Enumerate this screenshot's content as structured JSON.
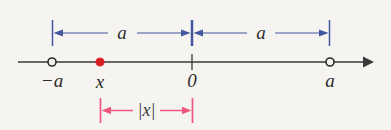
{
  "figure": {
    "kind": "number-line-diagram",
    "width": 391,
    "height": 130,
    "background_color": "#f6f4f1",
    "axis": {
      "color": "#3a3a3a",
      "y": 62,
      "x_start": 18,
      "x_end": 372,
      "arrow_right": true
    },
    "colors": {
      "axis": "#3a3a3a",
      "point_filled": "#d81f26",
      "point_open_stroke": "#2b2b2b",
      "point_open_fill": "#f6f4f1",
      "measure_blue": "#4257a0",
      "measure_red": "#f0577f",
      "text": "#2b2b2b"
    },
    "points": [
      {
        "name": "negative-a",
        "label": "−a",
        "x": 52,
        "marker": "open-circle"
      },
      {
        "name": "x",
        "label": "x",
        "x": 100,
        "marker": "filled-circle"
      },
      {
        "name": "zero",
        "label": "0",
        "x": 192,
        "marker": "tick"
      },
      {
        "name": "a",
        "label": "a",
        "x": 330,
        "marker": "open-circle"
      }
    ],
    "measures": [
      {
        "name": "left-a-span",
        "label": "a",
        "color": "#4257a0",
        "x_from": 52,
        "x_to": 192,
        "y": 33,
        "position": "above",
        "arrows": "both"
      },
      {
        "name": "right-a-span",
        "label": "a",
        "color": "#4257a0",
        "x_from": 192,
        "x_to": 330,
        "y": 33,
        "position": "above",
        "arrows": "both"
      },
      {
        "name": "abs-x-span",
        "label": "|x|",
        "color": "#f0577f",
        "x_from": 100,
        "x_to": 193,
        "y": 110,
        "position": "below",
        "arrows": "both"
      }
    ]
  }
}
